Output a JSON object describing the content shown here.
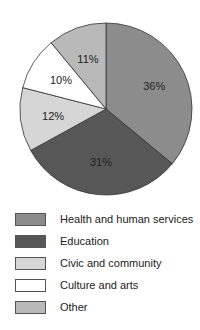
{
  "chart_data": {
    "type": "pie",
    "title": "",
    "categories": [
      "Health and human services",
      "Education",
      "Civic and community",
      "Culture and arts",
      "Other"
    ],
    "values": [
      36,
      31,
      12,
      10,
      11
    ],
    "labels": [
      "36%",
      "31%",
      "12%",
      "10%",
      "11%"
    ],
    "colors": [
      "#8c8c8c",
      "#575757",
      "#d6d6d6",
      "#ffffff",
      "#b9b9b9"
    ],
    "start_angle": "12 o'clock",
    "direction": "clockwise",
    "legend_position": "bottom"
  },
  "legend": {
    "items": [
      {
        "label": "Health and human services",
        "color": "#8c8c8c"
      },
      {
        "label": "Education",
        "color": "#575757"
      },
      {
        "label": "Civic and community",
        "color": "#d6d6d6"
      },
      {
        "label": "Culture and arts",
        "color": "#ffffff"
      },
      {
        "label": "Other",
        "color": "#b9b9b9"
      }
    ]
  }
}
